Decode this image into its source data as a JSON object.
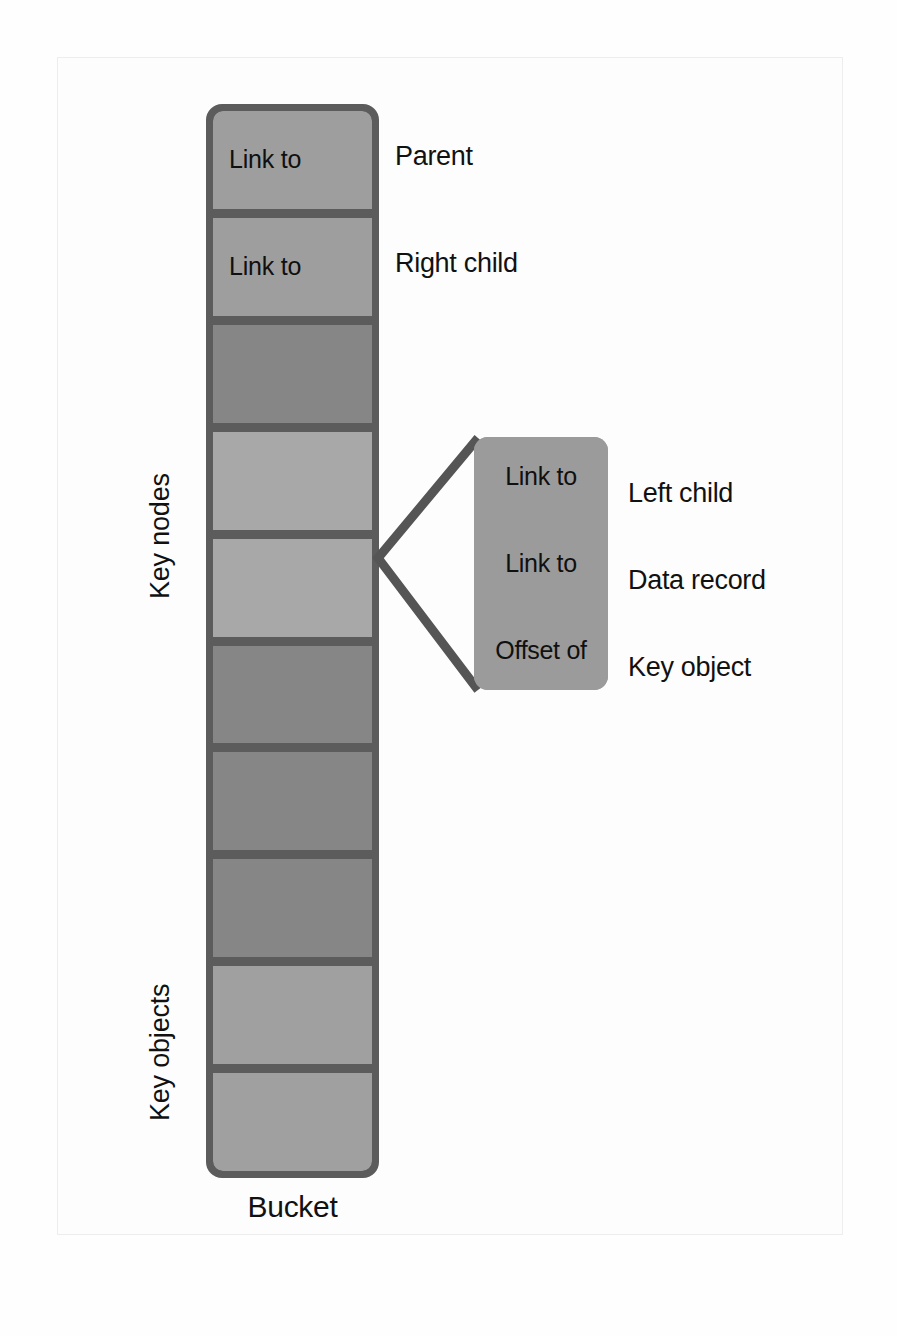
{
  "figure": {
    "caption": "Bucket",
    "group_labels": [
      {
        "text": "Key nodes"
      },
      {
        "text": "Key objects"
      }
    ]
  },
  "bucket": {
    "border_color": "#5c5c5c",
    "cells": [
      {
        "label": "Link to",
        "note": "Parent",
        "shade": "#9e9e9e"
      },
      {
        "label": "Link to",
        "note": "Right child",
        "shade": "#9e9e9e"
      },
      {
        "label": "",
        "note": "",
        "shade": "#868686"
      },
      {
        "label": "",
        "note": "",
        "shade": "#a8a8a8"
      },
      {
        "label": "",
        "note": "",
        "shade": "#a8a8a8"
      },
      {
        "label": "",
        "note": "",
        "shade": "#868686"
      },
      {
        "label": "",
        "note": "",
        "shade": "#868686"
      },
      {
        "label": "",
        "note": "",
        "shade": "#868686"
      },
      {
        "label": "",
        "note": "",
        "shade": "#a0a0a0"
      },
      {
        "label": "",
        "note": "",
        "shade": "#a0a0a0"
      }
    ]
  },
  "callout": {
    "background": "#9b9b9b",
    "cells": [
      {
        "label": "Link to",
        "note": "Left child"
      },
      {
        "label": "Link to",
        "note": "Data record"
      },
      {
        "label": "Offset of",
        "note": "Key object"
      }
    ]
  },
  "connector": {
    "color": "#555555",
    "shape": "expand-bracket"
  }
}
